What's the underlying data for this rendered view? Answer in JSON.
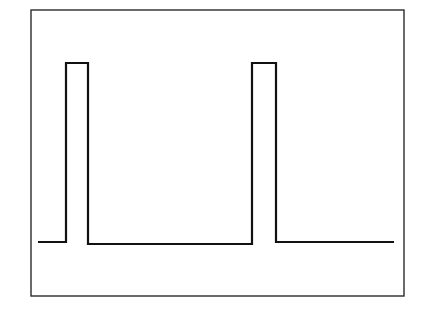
{
  "figure": {
    "title": "",
    "background_color": "#ffffff",
    "frame": {
      "stroke_color": "#2b2b2b",
      "stroke_width": 1.4,
      "x": 31,
      "y": 10,
      "width": 373,
      "height": 286
    },
    "trace": {
      "stroke_color": "#111111",
      "stroke_width": 2.2
    }
  },
  "chart_data": {
    "type": "line",
    "title": "",
    "subtitle": "",
    "xlabel": "",
    "ylabel": "",
    "xlim": [
      0,
      100
    ],
    "ylim": [
      0,
      100
    ],
    "grid": false,
    "legend": false,
    "axes_visible": false,
    "frame_visible": true,
    "xticks": [],
    "yticks": [],
    "xticklabels": [],
    "yticklabels": [],
    "annotations": [],
    "series": [
      {
        "name": "pulse-signal",
        "color": "#111111",
        "linewidth": 2.2,
        "x": [
          2.0,
          9.7,
          9.7,
          15.8,
          15.8,
          60.5,
          60.5,
          66.9,
          66.9,
          97.5
        ],
        "y": [
          18.6,
          18.6,
          81.0,
          81.0,
          17.9,
          17.9,
          81.0,
          81.0,
          18.6,
          18.6
        ]
      }
    ]
  },
  "geometry": {
    "points_px": [
      [
        38,
        242
      ],
      [
        66,
        242
      ],
      [
        66,
        63
      ],
      [
        88,
        63
      ],
      [
        88,
        244
      ],
      [
        252,
        244
      ],
      [
        252,
        63
      ],
      [
        276,
        63
      ],
      [
        276,
        242
      ],
      [
        394,
        242
      ]
    ]
  }
}
